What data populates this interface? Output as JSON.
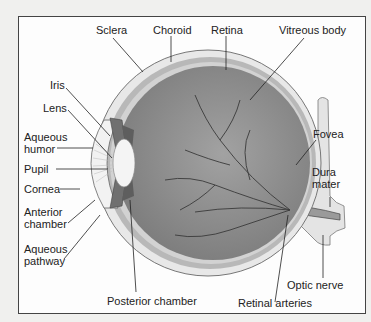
{
  "diagram": {
    "type": "anatomical cross-section",
    "labels": {
      "sclera": "Sclera",
      "choroid": "Choroid",
      "retina": "Retina",
      "vitreous_body": "Vitreous body",
      "iris": "Iris",
      "lens": "Lens",
      "aqueous_humor_1": "Aqueous",
      "aqueous_humor_2": "humor",
      "fovea": "Fovea",
      "pupil": "Pupil",
      "dura_mater_1": "Dura",
      "dura_mater_2": "mater",
      "cornea": "Cornea",
      "anterior_chamber_1": "Anterior",
      "anterior_chamber_2": "chamber",
      "aqueous_pathway_1": "Aqueous",
      "aqueous_pathway_2": "pathway",
      "optic_nerve": "Optic nerve",
      "posterior_chamber": "Posterior chamber",
      "retinal_arteries": "Retinal arteries"
    },
    "colors": {
      "background": "#f0f0ee",
      "panel": "#fdfdfd",
      "vitreous": "#8e8e8e",
      "sclera": "#e6e6e6",
      "choroid": "#b4b4b4",
      "vessels": "#3a3a3a",
      "leader_lines": "#222222"
    }
  }
}
